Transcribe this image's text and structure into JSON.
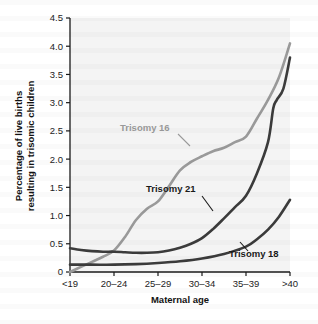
{
  "chart_data": {
    "type": "line",
    "title": "",
    "xlabel": "Maternal age",
    "ylabel": "Percentage of live births resulting in trisomic children",
    "ylabel_line1": "Percentage of live births",
    "ylabel_line2": "resulting in trisomic children",
    "categories": [
      "<19",
      "20–24",
      "25–29",
      "30–34",
      "35–39",
      ">40"
    ],
    "yticks": [
      "0",
      "0.5",
      "1.0",
      "1.5",
      "2.0",
      "2.5",
      "3.0",
      "3.5",
      "4.0",
      "4.5"
    ],
    "ytick_values": [
      0,
      0.5,
      1.0,
      1.5,
      2.0,
      2.5,
      3.0,
      3.5,
      4.0,
      4.5
    ],
    "ylim": [
      0,
      4.5
    ],
    "grid": false,
    "legend": "inline-annotations",
    "series": [
      {
        "name": "Trisomy 16",
        "color": "#9a9a9a",
        "label_color": "#9a9a9a",
        "values": [
          0.0,
          0.38,
          1.25,
          2.05,
          2.4,
          4.05
        ],
        "detail_points": [
          [
            0.0,
            0.0
          ],
          [
            0.25,
            0.09
          ],
          [
            0.5,
            0.18
          ],
          [
            0.75,
            0.27
          ],
          [
            1.0,
            0.38
          ],
          [
            1.25,
            0.62
          ],
          [
            1.5,
            0.92
          ],
          [
            1.75,
            1.12
          ],
          [
            2.0,
            1.25
          ],
          [
            2.25,
            1.52
          ],
          [
            2.5,
            1.8
          ],
          [
            2.75,
            1.95
          ],
          [
            3.0,
            2.05
          ],
          [
            3.25,
            2.14
          ],
          [
            3.5,
            2.2
          ],
          [
            3.75,
            2.3
          ],
          [
            4.0,
            2.4
          ],
          [
            4.25,
            2.72
          ],
          [
            4.5,
            3.05
          ],
          [
            4.75,
            3.45
          ],
          [
            5.0,
            4.05
          ]
        ]
      },
      {
        "name": "Trisomy 21",
        "color": "#3b3b3b",
        "label_color": "#1a1a1a",
        "values": [
          0.42,
          0.36,
          0.35,
          0.6,
          1.35,
          3.8
        ],
        "detail_points": [
          [
            0.0,
            0.42
          ],
          [
            0.25,
            0.39
          ],
          [
            0.5,
            0.37
          ],
          [
            0.75,
            0.36
          ],
          [
            1.0,
            0.36
          ],
          [
            1.25,
            0.35
          ],
          [
            1.5,
            0.34
          ],
          [
            1.75,
            0.34
          ],
          [
            2.0,
            0.35
          ],
          [
            2.25,
            0.38
          ],
          [
            2.5,
            0.43
          ],
          [
            2.75,
            0.5
          ],
          [
            3.0,
            0.6
          ],
          [
            3.25,
            0.76
          ],
          [
            3.5,
            0.95
          ],
          [
            3.75,
            1.15
          ],
          [
            4.0,
            1.35
          ],
          [
            4.25,
            1.75
          ],
          [
            4.5,
            2.3
          ],
          [
            4.62,
            2.9
          ],
          [
            4.7,
            3.05
          ],
          [
            4.85,
            3.25
          ],
          [
            5.0,
            3.8
          ]
        ]
      },
      {
        "name": "Trisomy 18",
        "color": "#3b3b3b",
        "label_color": "#1a1a1a",
        "values": [
          0.13,
          0.13,
          0.16,
          0.24,
          0.45,
          1.28
        ],
        "detail_points": [
          [
            0.0,
            0.13
          ],
          [
            0.5,
            0.13
          ],
          [
            1.0,
            0.13
          ],
          [
            1.5,
            0.14
          ],
          [
            2.0,
            0.16
          ],
          [
            2.5,
            0.19
          ],
          [
            3.0,
            0.24
          ],
          [
            3.5,
            0.32
          ],
          [
            4.0,
            0.45
          ],
          [
            4.25,
            0.58
          ],
          [
            4.5,
            0.75
          ],
          [
            4.75,
            0.98
          ],
          [
            5.0,
            1.28
          ]
        ]
      }
    ],
    "annotations": [
      {
        "text": "Trisomy 16",
        "label_x": 120,
        "label_y": 131,
        "leader": "M 178 134 L 190 146"
      },
      {
        "text": "Trisomy 21",
        "label_x": 146,
        "label_y": 192,
        "leader": "M 202 196 L 213 211"
      },
      {
        "text": "Trisomy 18",
        "label_x": 229,
        "label_y": 257,
        "leader": "M 248 251 L 240 242"
      }
    ]
  },
  "axes": {
    "x_axis_name": "maternal-age-axis",
    "y_axis_name": "percentage-axis"
  }
}
